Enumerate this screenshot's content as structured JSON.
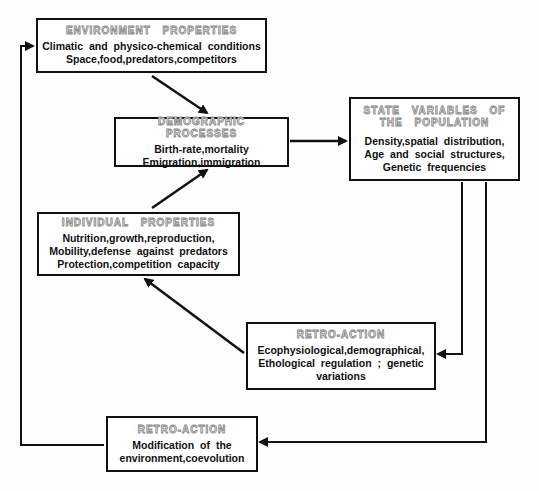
{
  "boxes": {
    "environment": {
      "title": "ENVIRONMENT PROPERTIES",
      "lines": [
        "Climatic and physico-chemical conditions",
        "Space,food,predators,competitors"
      ]
    },
    "demographic": {
      "title": "DEMOGRAPHIC PROCESSES",
      "lines": [
        "Birth-rate,mortality",
        "Emigration,immigration"
      ]
    },
    "state": {
      "title_lines": [
        "STATE VARIABLES OF",
        "THE POPULATION"
      ],
      "lines": [
        "Density,spatial distribution,",
        "Age and social structures,",
        "Genetic frequencies"
      ]
    },
    "individual": {
      "title": "INDIVIDUAL PROPERTIES",
      "lines": [
        "Nutrition,growth,reproduction,",
        "Mobility,defense against predators",
        "Protection,competition capacity"
      ]
    },
    "retro1": {
      "title": "RETRO-ACTION",
      "lines": [
        "Ecophysiological,demographical,",
        "Ethological regulation ; genetic",
        "variations"
      ]
    },
    "retro2": {
      "title": "RETRO-ACTION",
      "lines": [
        "Modification of the",
        "environment,coevolution"
      ]
    }
  },
  "colors": {
    "line": "#111111",
    "title_outline": "#888888"
  }
}
